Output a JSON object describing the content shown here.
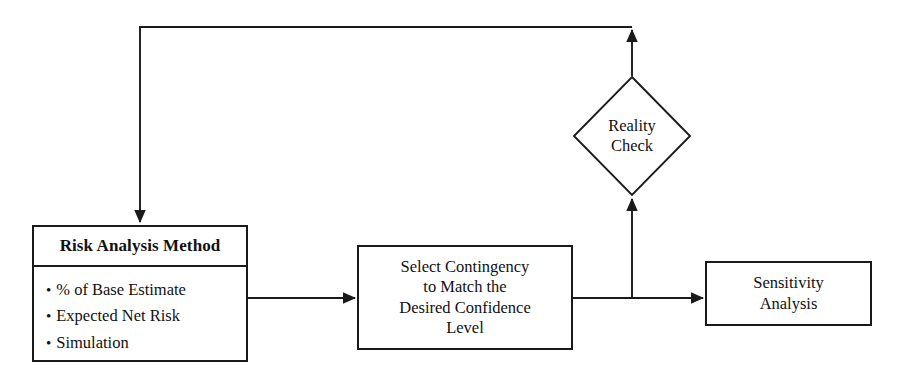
{
  "diagram": {
    "background_color": "#ffffff",
    "line_color": "#1a1a1a",
    "nodes": {
      "risk_analysis": {
        "header": "Risk Analysis Method",
        "bullets": [
          "% of Base Estimate",
          "Expected Net Risk",
          "Simulation"
        ],
        "bullet_glyph": "•"
      },
      "select_contingency": {
        "lines": [
          "Select Contingency",
          "to Match the",
          "Desired Confidence",
          "Level"
        ]
      },
      "sensitivity_analysis": {
        "lines": [
          "Sensitivity",
          "Analysis"
        ]
      },
      "reality_check": {
        "lines": [
          "Reality",
          "Check"
        ],
        "shape": "diamond"
      }
    },
    "edges": [
      {
        "name": "risk-analysis-to-select-contingency",
        "from": "risk_analysis",
        "to": "select_contingency",
        "label": "",
        "direction": "right"
      },
      {
        "name": "select-contingency-to-sensitivity-analysis",
        "from": "select_contingency",
        "to": "sensitivity_analysis",
        "label": "",
        "direction": "right"
      },
      {
        "name": "select-contingency-to-reality-check",
        "from": "select_contingency",
        "to": "reality_check",
        "label": "",
        "direction": "up"
      },
      {
        "name": "reality-check-feedback-to-risk-analysis",
        "from": "reality_check",
        "to": "risk_analysis",
        "label": "",
        "direction": "up-left-down"
      }
    ]
  }
}
